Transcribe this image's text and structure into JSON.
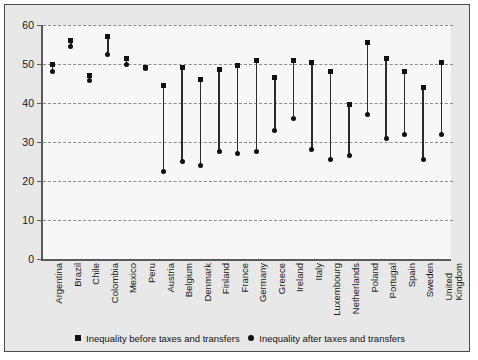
{
  "chart_data": {
    "type": "scatter",
    "title": "",
    "xlabel": "",
    "ylabel": "",
    "ylim": [
      0,
      60
    ],
    "yticks": [
      0,
      10,
      20,
      30,
      40,
      50,
      60
    ],
    "grid": true,
    "legend_position": "bottom",
    "categories": [
      "Argentina",
      "Brazil",
      "Chile",
      "Colombia",
      "Mexico",
      "Peru",
      "Austria",
      "Belgium",
      "Denmark",
      "Finland",
      "France",
      "Germany",
      "Greece",
      "Ireland",
      "Italy",
      "Luxembourg",
      "Netherlands",
      "Poland",
      "Portugal",
      "Spain",
      "Sweden",
      "United\nKingdom"
    ],
    "series": [
      {
        "name": "Inequality before taxes and transfers",
        "marker": "square",
        "values": [
          50.0,
          56.0,
          47.0,
          57.0,
          51.5,
          49.0,
          44.5,
          49.0,
          46.0,
          48.5,
          49.5,
          51.0,
          46.5,
          51.0,
          50.5,
          48.0,
          39.5,
          55.5,
          51.5,
          48.0,
          44.0,
          50.5
        ]
      },
      {
        "name": "Inequality after taxes and transfers",
        "marker": "circle",
        "values": [
          48.0,
          54.5,
          45.8,
          52.5,
          50.0,
          48.8,
          22.5,
          25.0,
          24.0,
          27.5,
          27.0,
          27.5,
          33.0,
          36.0,
          28.0,
          25.5,
          26.5,
          37.0,
          31.0,
          32.0,
          25.5,
          32.0
        ]
      }
    ]
  },
  "legend": {
    "items": [
      {
        "label": "Inequality before taxes and transfers",
        "marker": "square-marker-icon"
      },
      {
        "label": "Inequality after taxes and transfers",
        "marker": "circle-marker-icon"
      }
    ]
  }
}
